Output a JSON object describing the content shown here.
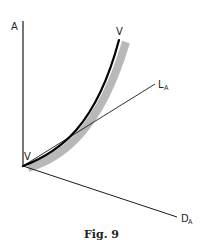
{
  "figure": {
    "caption": "Fig. 9",
    "colors": {
      "axis": "#1a1a1a",
      "curve": "#000000",
      "band": "#b8b8b8",
      "text": "#222222",
      "background": "#ffffff"
    },
    "axes": {
      "vertical": {
        "label": "A"
      },
      "line_l": {
        "label_main": "L",
        "label_sub": "A"
      },
      "line_d": {
        "label_main": "D",
        "label_sub": "A"
      }
    },
    "curve": {
      "label_top": "V",
      "label_bottom": "V"
    }
  }
}
